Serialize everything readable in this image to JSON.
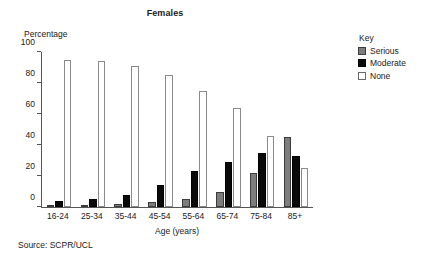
{
  "chart_data": {
    "type": "bar",
    "title": "Females",
    "xlabel": "Age (years)",
    "ylabel": "Percentage",
    "ylim": [
      0,
      100
    ],
    "yticks": [
      0,
      20,
      40,
      60,
      80,
      100
    ],
    "grid": false,
    "legend_position": "right",
    "legend_title": "Key",
    "categories": [
      "16-24",
      "25-34",
      "35-44",
      "45-54",
      "55-64",
      "65-74",
      "75-84",
      "85+"
    ],
    "series": [
      {
        "name": "Serious",
        "color": "#7d7d7d",
        "values": [
          1,
          1,
          2,
          3,
          5,
          10,
          22,
          45
        ]
      },
      {
        "name": "Moderate",
        "color": "#0a0a0a",
        "values": [
          4,
          5,
          8,
          14,
          23,
          29,
          35,
          33
        ]
      },
      {
        "name": "None",
        "color": "#ffffff",
        "values": [
          95,
          94,
          91,
          85,
          75,
          64,
          46,
          25
        ]
      }
    ],
    "source": "Source: SCPR/UCL"
  }
}
